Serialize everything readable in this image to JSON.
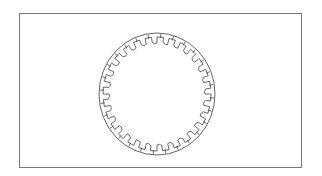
{
  "figure": {
    "frame_color": "#7a7a7a",
    "line_color": "#4a4a4a",
    "background": "#ffffff",
    "ring": {
      "center": [
        157,
        94
      ],
      "outer_radius": [
        58,
        61
      ],
      "inner_radius": [
        50,
        53
      ],
      "segment_count": 28
    }
  }
}
